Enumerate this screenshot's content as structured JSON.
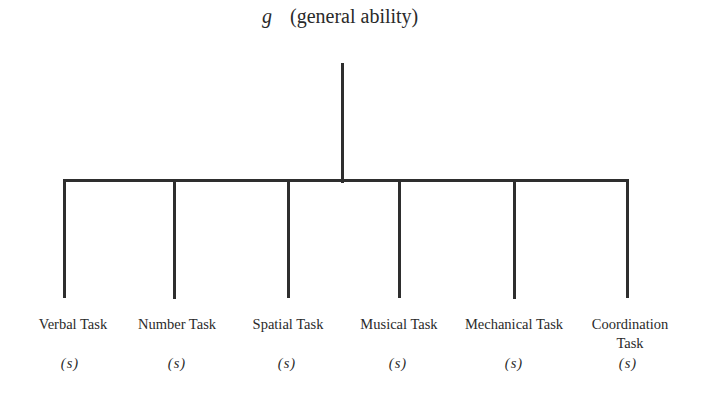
{
  "diagram": {
    "root": {
      "symbol": "g",
      "label": "(general ability)"
    },
    "children": [
      {
        "label": "Verbal Task",
        "factor": "(s)",
        "x": 73
      },
      {
        "label": "Number Task",
        "factor": "(s)",
        "x": 177
      },
      {
        "label": "Spatial Task",
        "factor": "(s)",
        "x": 288
      },
      {
        "label": "Musical Task",
        "factor": "(s)",
        "x": 399
      },
      {
        "label": "Mechanical Task",
        "factor": "(s)",
        "x": 514
      },
      {
        "label": "Coordination Task",
        "factor": "(s)",
        "x": 628
      }
    ],
    "line_color": "#2e2e2e"
  }
}
